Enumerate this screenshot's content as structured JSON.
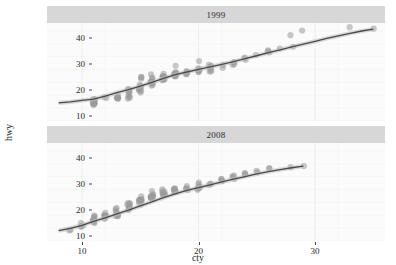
{
  "chart_data": {
    "type": "scatter",
    "title": "",
    "xlabel": "cty",
    "ylabel": "hwy",
    "xlim": [
      7,
      36
    ],
    "ylim": [
      8,
      46
    ],
    "xticks": [
      10,
      20,
      30
    ],
    "yticks": [
      10,
      20,
      30,
      40
    ],
    "grid": true,
    "legend": null,
    "facet_variable": "year",
    "point_color": "#9a9a9a",
    "point_opacity": 0.55,
    "line_color": "#4a4a4a",
    "panel_bg": "#fbfbfb",
    "strip_bg": "#d7d7d7",
    "facets": [
      {
        "label": "1999",
        "points": [
          [
            18,
            29
          ],
          [
            21,
            29
          ],
          [
            20,
            31
          ],
          [
            21,
            30
          ],
          [
            16,
            26
          ],
          [
            18,
            26
          ],
          [
            18,
            27
          ],
          [
            16,
            25
          ],
          [
            20,
            28
          ],
          [
            19,
            27
          ],
          [
            15,
            25
          ],
          [
            17,
            25
          ],
          [
            17,
            25
          ],
          [
            15,
            25
          ],
          [
            15,
            24
          ],
          [
            17,
            25
          ],
          [
            16,
            23
          ],
          [
            14,
            20
          ],
          [
            11,
            15
          ],
          [
            14,
            20
          ],
          [
            13,
            17
          ],
          [
            12,
            17
          ],
          [
            16,
            23
          ],
          [
            15,
            21
          ],
          [
            16,
            23
          ],
          [
            15,
            22
          ],
          [
            11,
            16
          ],
          [
            14,
            18
          ],
          [
            11,
            15
          ],
          [
            11,
            15
          ],
          [
            11,
            16
          ],
          [
            11,
            16
          ],
          [
            14,
            19
          ],
          [
            13,
            17
          ],
          [
            14,
            17
          ],
          [
            15,
            19
          ],
          [
            15,
            20
          ],
          [
            14,
            20
          ],
          [
            11,
            15
          ],
          [
            11,
            15
          ],
          [
            11,
            15
          ],
          [
            11,
            15
          ],
          [
            11,
            16
          ],
          [
            13,
            17
          ],
          [
            13,
            17
          ],
          [
            11,
            15
          ],
          [
            11,
            14
          ],
          [
            15,
            20
          ],
          [
            16,
            22
          ],
          [
            15,
            20
          ],
          [
            14,
            17
          ],
          [
            13,
            17
          ],
          [
            11,
            15
          ],
          [
            11,
            16
          ],
          [
            14,
            17
          ],
          [
            13,
            17
          ],
          [
            21,
            27
          ],
          [
            19,
            26
          ],
          [
            23,
            30
          ],
          [
            23,
            31
          ],
          [
            19,
            26
          ],
          [
            18,
            25
          ],
          [
            19,
            27
          ],
          [
            17,
            25
          ],
          [
            18,
            26
          ],
          [
            17,
            24
          ],
          [
            16,
            23
          ],
          [
            18,
            26
          ],
          [
            20,
            28
          ],
          [
            21,
            29
          ],
          [
            18,
            26
          ],
          [
            17,
            25
          ],
          [
            18,
            26
          ],
          [
            21,
            29
          ],
          [
            20,
            27
          ],
          [
            17,
            24
          ],
          [
            19,
            26
          ],
          [
            16,
            23
          ],
          [
            23,
            31
          ],
          [
            24,
            33
          ],
          [
            26,
            35
          ],
          [
            21,
            28
          ],
          [
            20,
            27
          ],
          [
            22,
            29
          ],
          [
            23,
            30
          ],
          [
            24,
            32
          ],
          [
            18,
            25
          ],
          [
            16,
            24
          ],
          [
            17,
            25
          ],
          [
            18,
            26
          ],
          [
            17,
            24
          ],
          [
            16,
            23
          ],
          [
            15,
            22
          ],
          [
            17,
            26
          ],
          [
            18,
            27
          ],
          [
            20,
            28
          ],
          [
            21,
            29
          ],
          [
            26,
            35
          ],
          [
            28,
            41
          ],
          [
            29,
            43
          ],
          [
            33,
            44
          ],
          [
            35,
            44
          ],
          [
            25,
            34
          ],
          [
            24,
            32
          ],
          [
            27,
            36
          ],
          [
            26,
            35
          ],
          [
            28,
            37
          ],
          [
            22,
            30
          ],
          [
            21,
            29
          ],
          [
            20,
            28
          ],
          [
            21,
            27
          ],
          [
            17,
            24
          ],
          [
            16,
            23
          ],
          [
            15,
            20
          ],
          [
            14,
            19
          ],
          [
            16,
            22
          ],
          [
            18,
            26
          ],
          [
            15,
            21
          ],
          [
            14,
            20
          ],
          [
            13,
            18
          ],
          [
            12,
            17
          ],
          [
            11,
            16
          ],
          [
            16,
            23
          ],
          [
            17,
            25
          ],
          [
            19,
            27
          ],
          [
            18,
            26
          ]
        ],
        "smooth": [
          [
            8,
            15.0
          ],
          [
            9,
            15.4
          ],
          [
            10,
            16.0
          ],
          [
            11,
            16.5
          ],
          [
            12,
            17.6
          ],
          [
            13,
            19.0
          ],
          [
            14,
            20.2
          ],
          [
            15,
            21.5
          ],
          [
            16,
            23.0
          ],
          [
            17,
            24.5
          ],
          [
            18,
            26.0
          ],
          [
            19,
            27.0
          ],
          [
            20,
            28.0
          ],
          [
            21,
            29.0
          ],
          [
            22,
            30.0
          ],
          [
            23,
            31.0
          ],
          [
            24,
            32.2
          ],
          [
            25,
            33.3
          ],
          [
            26,
            34.5
          ],
          [
            27,
            35.6
          ],
          [
            28,
            36.7
          ],
          [
            29,
            37.8
          ],
          [
            30,
            38.9
          ],
          [
            31,
            40.0
          ],
          [
            32,
            41.0
          ],
          [
            33,
            42.0
          ],
          [
            34,
            42.9
          ],
          [
            35,
            43.6
          ]
        ]
      },
      {
        "label": "2008",
        "points": [
          [
            18,
            27
          ],
          [
            18,
            28
          ],
          [
            21,
            30
          ],
          [
            20,
            31
          ],
          [
            16,
            26
          ],
          [
            16,
            26
          ],
          [
            17,
            26
          ],
          [
            15,
            25
          ],
          [
            18,
            28
          ],
          [
            17,
            27
          ],
          [
            16,
            25
          ],
          [
            16,
            25
          ],
          [
            15,
            24
          ],
          [
            15,
            24
          ],
          [
            14,
            23
          ],
          [
            16,
            25
          ],
          [
            14,
            22
          ],
          [
            12,
            18
          ],
          [
            9,
            12
          ],
          [
            13,
            19
          ],
          [
            12,
            17
          ],
          [
            11,
            16
          ],
          [
            15,
            23
          ],
          [
            14,
            21
          ],
          [
            15,
            24
          ],
          [
            14,
            22
          ],
          [
            11,
            16
          ],
          [
            13,
            18
          ],
          [
            9,
            12
          ],
          [
            10,
            14
          ],
          [
            11,
            17
          ],
          [
            11,
            17
          ],
          [
            13,
            19
          ],
          [
            12,
            18
          ],
          [
            13,
            18
          ],
          [
            14,
            20
          ],
          [
            14,
            21
          ],
          [
            13,
            20
          ],
          [
            10,
            14
          ],
          [
            11,
            15
          ],
          [
            11,
            16
          ],
          [
            11,
            16
          ],
          [
            12,
            17
          ],
          [
            12,
            18
          ],
          [
            13,
            18
          ],
          [
            11,
            15
          ],
          [
            10,
            14
          ],
          [
            14,
            21
          ],
          [
            15,
            22
          ],
          [
            14,
            20
          ],
          [
            13,
            18
          ],
          [
            12,
            18
          ],
          [
            11,
            16
          ],
          [
            11,
            17
          ],
          [
            13,
            18
          ],
          [
            12,
            18
          ],
          [
            20,
            28
          ],
          [
            18,
            27
          ],
          [
            22,
            31
          ],
          [
            23,
            32
          ],
          [
            18,
            27
          ],
          [
            17,
            26
          ],
          [
            18,
            28
          ],
          [
            16,
            25
          ],
          [
            17,
            26
          ],
          [
            16,
            25
          ],
          [
            15,
            24
          ],
          [
            17,
            26
          ],
          [
            19,
            28
          ],
          [
            20,
            29
          ],
          [
            17,
            26
          ],
          [
            16,
            25
          ],
          [
            17,
            26
          ],
          [
            20,
            29
          ],
          [
            19,
            28
          ],
          [
            16,
            25
          ],
          [
            18,
            27
          ],
          [
            15,
            24
          ],
          [
            22,
            32
          ],
          [
            23,
            33
          ],
          [
            24,
            34
          ],
          [
            20,
            29
          ],
          [
            19,
            28
          ],
          [
            21,
            30
          ],
          [
            22,
            31
          ],
          [
            23,
            33
          ],
          [
            17,
            26
          ],
          [
            15,
            24
          ],
          [
            16,
            25
          ],
          [
            17,
            26
          ],
          [
            16,
            25
          ],
          [
            15,
            24
          ],
          [
            14,
            23
          ],
          [
            16,
            27
          ],
          [
            17,
            28
          ],
          [
            19,
            29
          ],
          [
            20,
            30
          ],
          [
            24,
            34
          ],
          [
            25,
            35
          ],
          [
            26,
            36
          ],
          [
            28,
            37
          ],
          [
            29,
            37
          ],
          [
            23,
            33
          ],
          [
            22,
            32
          ],
          [
            25,
            35
          ],
          [
            24,
            34
          ],
          [
            26,
            36
          ],
          [
            21,
            30
          ],
          [
            20,
            29
          ],
          [
            19,
            28
          ],
          [
            20,
            28
          ],
          [
            16,
            25
          ],
          [
            15,
            24
          ],
          [
            14,
            21
          ],
          [
            13,
            20
          ],
          [
            15,
            23
          ],
          [
            17,
            27
          ],
          [
            14,
            22
          ],
          [
            13,
            21
          ],
          [
            12,
            19
          ],
          [
            11,
            18
          ],
          [
            10,
            15
          ],
          [
            15,
            24
          ],
          [
            16,
            25
          ],
          [
            18,
            28
          ],
          [
            17,
            27
          ]
        ],
        "smooth": [
          [
            8,
            12.0
          ],
          [
            9,
            12.9
          ],
          [
            10,
            14.1
          ],
          [
            11,
            15.6
          ],
          [
            12,
            17.0
          ],
          [
            13,
            18.5
          ],
          [
            14,
            20.0
          ],
          [
            15,
            21.6
          ],
          [
            16,
            23.2
          ],
          [
            17,
            24.8
          ],
          [
            18,
            26.3
          ],
          [
            19,
            27.6
          ],
          [
            20,
            28.7
          ],
          [
            21,
            29.8
          ],
          [
            22,
            30.9
          ],
          [
            23,
            32.0
          ],
          [
            24,
            33.0
          ],
          [
            25,
            34.0
          ],
          [
            26,
            34.9
          ],
          [
            27,
            35.7
          ],
          [
            28,
            36.4
          ],
          [
            29,
            37.0
          ]
        ]
      }
    ]
  }
}
